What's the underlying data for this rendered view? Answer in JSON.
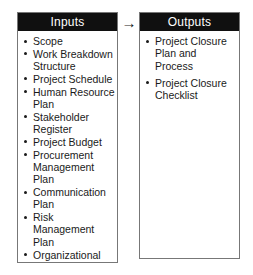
{
  "diagram": {
    "flow_arrow_glyph": "→",
    "flow_arrow_name": "arrow-right-icon",
    "colors": {
      "header_background": "#101010",
      "header_text": "#ffffff",
      "panel_border": "#777777",
      "panel_background": "#ffffff",
      "body_text": "#1a1a1a"
    },
    "inputs": {
      "title": "Inputs",
      "items": [
        "Scope",
        "Work Breakdown Structure",
        "Project Schedule",
        "Human Resource Plan",
        "Stakeholder Register",
        "Project Budget",
        "Procurement Management Plan",
        "Communication Plan",
        "Risk Management Plan",
        "Organizational Processes"
      ]
    },
    "outputs": {
      "title": "Outputs",
      "items": [
        "Project Closure Plan and Process",
        "Project Closure Checklist"
      ]
    }
  }
}
